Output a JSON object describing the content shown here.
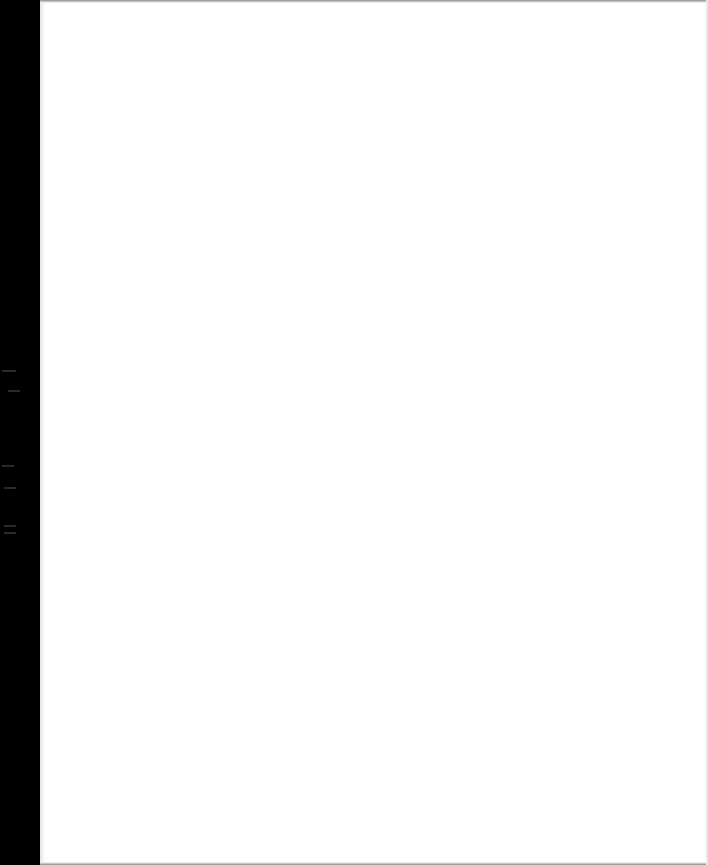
{
  "document": {
    "type": "scanned-page",
    "content_text": "",
    "is_blank": true
  },
  "colors": {
    "border": "#000000",
    "page": "#ffffff"
  }
}
